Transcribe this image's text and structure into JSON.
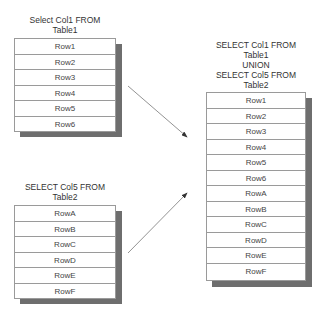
{
  "table1": {
    "caption_line1": "Select Col1 FROM",
    "caption_line2": "Table1",
    "rows": [
      "Row1",
      "Row2",
      "Row3",
      "Row4",
      "Row5",
      "Row6"
    ]
  },
  "table2": {
    "caption_line1": "SELECT Col5 FROM",
    "caption_line2": "Table2",
    "rows": [
      "RowA",
      "RowB",
      "RowC",
      "RowD",
      "RowE",
      "RowF"
    ]
  },
  "result": {
    "caption_line1": "SELECT Col1 FROM",
    "caption_line2": "Table1",
    "caption_line3": "UNION",
    "caption_line4": "SELECT Col5 FROM",
    "caption_line5": "Table2",
    "rows": [
      "Row1",
      "Row2",
      "Row3",
      "Row4",
      "Row5",
      "Row6",
      "RowA",
      "RowB",
      "RowC",
      "RowD",
      "RowE",
      "RowF"
    ]
  },
  "colors": {
    "border": "#9a9a9a",
    "shadow": "#6e6e6e",
    "arrow": "#555555"
  }
}
